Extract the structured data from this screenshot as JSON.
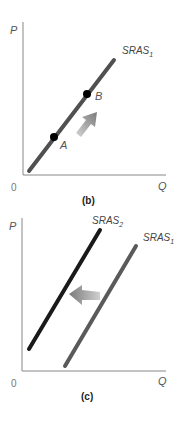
{
  "panels": [
    {
      "caption": "(b)",
      "y_axis_label": "P",
      "x_axis_label": "Q",
      "origin_label": "0",
      "curves": [
        {
          "name": "SRAS",
          "subscript": "1",
          "color": "#505050"
        }
      ],
      "points": [
        {
          "label": "A"
        },
        {
          "label": "B"
        }
      ],
      "arrow_direction": "up-right (movement along curve from A to B)"
    },
    {
      "caption": "(c)",
      "y_axis_label": "P",
      "x_axis_label": "Q",
      "origin_label": "0",
      "curves": [
        {
          "name": "SRAS",
          "subscript": "2",
          "color": "#1a1a1a"
        },
        {
          "name": "SRAS",
          "subscript": "1",
          "color": "#5a5a5a"
        }
      ],
      "arrow_direction": "left (shift from SRAS1 to SRAS2)"
    }
  ],
  "colors": {
    "axis": "#888888",
    "arrow_start": "#c8c8c8",
    "arrow_end": "#808080",
    "point": "#000000"
  }
}
